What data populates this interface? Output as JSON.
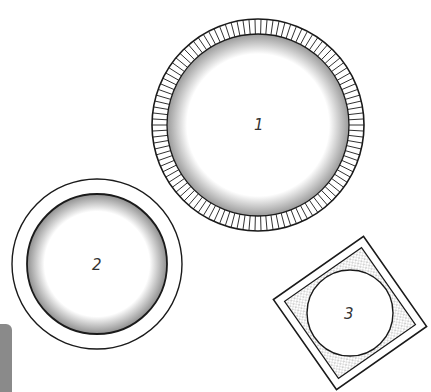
{
  "diagram": {
    "title": "",
    "items": [
      {
        "id": 1,
        "label": "1",
        "shape": "circle",
        "style": "hatched rim with stippled inner ring",
        "cx": 258,
        "cy": 125,
        "r_outer": 106,
        "r_inner": 91
      },
      {
        "id": 2,
        "label": "2",
        "shape": "circle",
        "style": "plain rim with stippled inner fill edge",
        "cx": 97,
        "cy": 264,
        "r_outer": 85,
        "r_inner": 70
      },
      {
        "id": 3,
        "label": "3",
        "shape": "rotated square with inscribed circle",
        "style": "double-line square, stippled corners",
        "cx": 350,
        "cy": 313,
        "half": 55
      }
    ]
  },
  "colors": {
    "ink": "#1a1a1a",
    "paper": "#ffffff",
    "edge_thumb": "#8a8a8a"
  }
}
